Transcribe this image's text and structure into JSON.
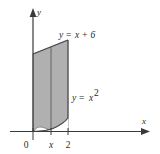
{
  "figure": {
    "kind": "cartesian-plot",
    "background_color": "#ffffff",
    "ink_color": "#2b2b2b",
    "shade_fill_color": "#b0b0b0",
    "shade_edge_color": "#555555",
    "axes": {
      "x_axis_label": "x",
      "y_axis_label": "y",
      "origin_label": "0",
      "x_ticks": [
        {
          "label": "x",
          "value": "x"
        },
        {
          "label": "2",
          "value": "2"
        }
      ]
    },
    "curves": [
      {
        "name": "upper-boundary-line",
        "label": "y = x + 6",
        "label_parts": {
          "lhs": "y",
          "eq": "=",
          "rhs": "x + 6"
        }
      },
      {
        "name": "lower-boundary-parabola",
        "label": "y = x²",
        "label_parts": {
          "lhs": "y",
          "eq": "=",
          "base": "x",
          "exponent": "2"
        }
      }
    ],
    "region": {
      "name": "shaded-region",
      "description": "region between y = x + 6 and y = x squared from 0 to 2"
    },
    "strip": {
      "name": "vertical-strip",
      "at": "x"
    }
  }
}
